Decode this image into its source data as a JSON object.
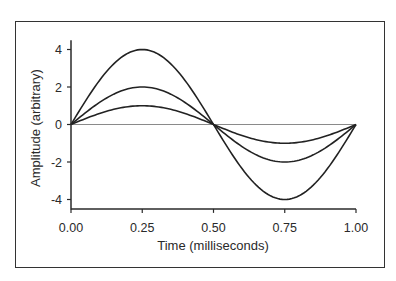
{
  "chart_data": {
    "type": "line",
    "title": "",
    "xlabel": "Time (milliseconds)",
    "ylabel": "Amplitude (arbitrary)",
    "xlim": [
      0,
      1
    ],
    "ylim": [
      -4.5,
      4.5
    ],
    "x_ticks": [
      "0.00",
      "0.25",
      "0.50",
      "0.75",
      "1.00"
    ],
    "y_ticks": [
      "4",
      "2",
      "0",
      "-2",
      "-4"
    ],
    "grid": false,
    "legend": null,
    "zero_line": true,
    "x": [
      0,
      0.05,
      0.1,
      0.15,
      0.2,
      0.25,
      0.3,
      0.35,
      0.4,
      0.45,
      0.5,
      0.55,
      0.6,
      0.65,
      0.7,
      0.75,
      0.8,
      0.85,
      0.9,
      0.95,
      1.0
    ],
    "series": [
      {
        "name": "amplitude 4",
        "amplitude": 4,
        "values": [
          0,
          1.24,
          2.35,
          3.24,
          3.8,
          4.0,
          3.8,
          3.24,
          2.35,
          1.24,
          0,
          -1.24,
          -2.35,
          -3.24,
          -3.8,
          -4.0,
          -3.8,
          -3.24,
          -2.35,
          -1.24,
          0
        ]
      },
      {
        "name": "amplitude 2",
        "amplitude": 2,
        "values": [
          0,
          0.62,
          1.18,
          1.62,
          1.9,
          2.0,
          1.9,
          1.62,
          1.18,
          0.62,
          0,
          -0.62,
          -1.18,
          -1.62,
          -1.9,
          -2.0,
          -1.9,
          -1.62,
          -1.18,
          -0.62,
          0
        ]
      },
      {
        "name": "amplitude 1",
        "amplitude": 1,
        "values": [
          0,
          0.31,
          0.59,
          0.81,
          0.95,
          1.0,
          0.95,
          0.81,
          0.59,
          0.31,
          0,
          -0.31,
          -0.59,
          -0.81,
          -0.95,
          -1.0,
          -0.95,
          -0.81,
          -0.59,
          -0.31,
          0
        ]
      }
    ],
    "colors": {
      "curve": "#222222",
      "zero_line": "#8a8a8a",
      "axis": "#2a2a2a",
      "frame": "#333333"
    }
  }
}
